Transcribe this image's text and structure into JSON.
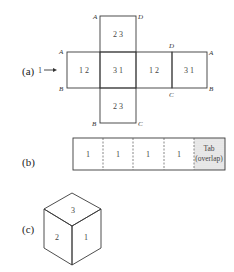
{
  "figure": {
    "part_a": {
      "label": "(a)",
      "arrow_label": "1",
      "faces": {
        "top": "2 3",
        "left": "1 2",
        "center": "3 1",
        "right1": "1 2",
        "right2": "3 1",
        "bottom": "2 3"
      },
      "vertices": {
        "top_left": "A",
        "top_right": "D",
        "left_top": "A",
        "left_bottom": "B",
        "right_top_inner": "D",
        "right_top_outer": "A",
        "right_bottom_inner": "C",
        "right_bottom_outer": "B",
        "bottom_left": "B",
        "bottom_right": "C"
      }
    },
    "part_b": {
      "label": "(b)",
      "segments": [
        "1",
        "1",
        "1",
        "1"
      ],
      "tab_line1": "Tab",
      "tab_line2": "(overlap)"
    },
    "part_c": {
      "label": "(c)",
      "faces": {
        "top": "3",
        "left": "2",
        "right": "1"
      }
    }
  },
  "colors": {
    "line": "#3a3a3a",
    "tab_fill": "#d8d8d8"
  }
}
